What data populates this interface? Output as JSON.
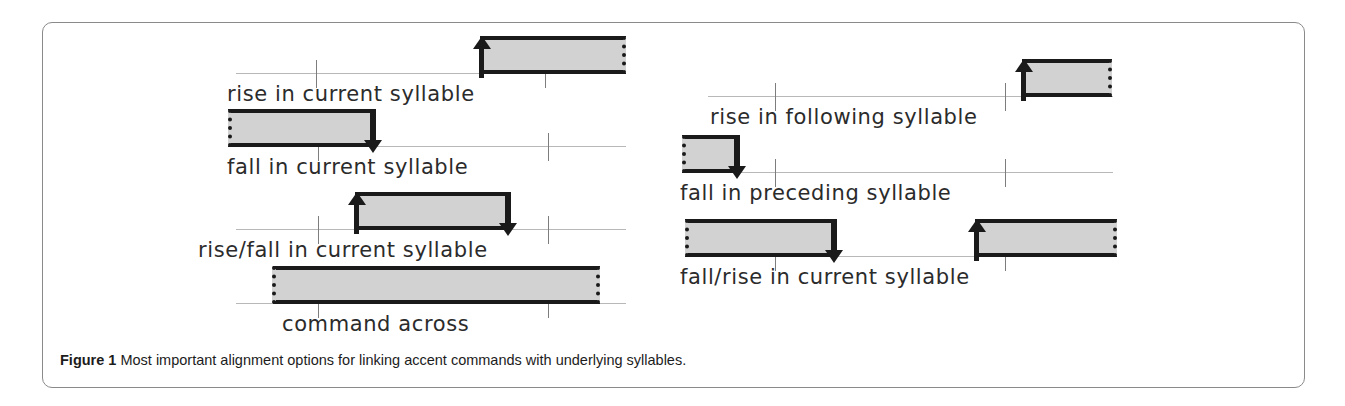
{
  "figure": {
    "caption_label": "Figure 1",
    "caption_text": "Most important alignment options for linking accent commands with underlying syllables.",
    "colors": {
      "box_fill": "#d2d2d2",
      "box_border": "#1a1a1a",
      "baseline": "#b8b8b8",
      "tick": "#7d7d7d",
      "frame": "#8a8a8a"
    }
  },
  "panels": [
    {
      "id": "rise-in-current-syllable",
      "label": "rise in current syllable",
      "arrows": [
        "up-left"
      ],
      "box_edges": {
        "left": "solid",
        "right": "dotted"
      },
      "alignment": "box starts inside current syllable, extends right"
    },
    {
      "id": "fall-in-current-syllable",
      "label": "fall in current syllable",
      "arrows": [
        "down-right"
      ],
      "box_edges": {
        "left": "dotted",
        "right": "solid"
      },
      "alignment": "box ends inside current syllable, extends left"
    },
    {
      "id": "rise-fall-in-current-syllable",
      "label": "rise/fall in current syllable",
      "arrows": [
        "up-left",
        "down-right"
      ],
      "box_edges": {
        "left": "solid",
        "right": "solid"
      },
      "alignment": "box fully contained within current syllable"
    },
    {
      "id": "command-across",
      "label": "command across",
      "arrows": [],
      "box_edges": {
        "left": "dotted",
        "right": "dotted"
      },
      "alignment": "box spans across both syllable boundaries"
    },
    {
      "id": "rise-in-following-syllable",
      "label": "rise in following syllable",
      "arrows": [
        "up-left"
      ],
      "box_edges": {
        "left": "solid",
        "right": "dotted"
      },
      "alignment": "box begins after the second tick"
    },
    {
      "id": "fall-in-preceding-syllable",
      "label": "fall in preceding syllable",
      "arrows": [
        "down-right"
      ],
      "box_edges": {
        "left": "dotted",
        "right": "solid"
      },
      "alignment": "box ends before the first tick"
    },
    {
      "id": "fall-rise-in-current-syllable",
      "label": "fall/rise in current syllable",
      "arrows": [
        "down-right",
        "up-left"
      ],
      "box_edges": {
        "left": "dotted",
        "right": "dotted"
      },
      "alignment": "two boxes: falling box then rising box"
    }
  ]
}
